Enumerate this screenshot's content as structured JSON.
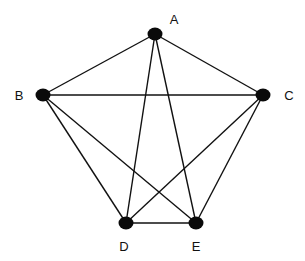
{
  "diagram": {
    "type": "graph",
    "nodes": [
      {
        "id": "A",
        "label": "A",
        "x": 155,
        "y": 34,
        "lx": 174,
        "ly": 24
      },
      {
        "id": "B",
        "label": "B",
        "x": 43,
        "y": 95,
        "lx": 19,
        "ly": 100
      },
      {
        "id": "C",
        "label": "C",
        "x": 263,
        "y": 95,
        "lx": 289,
        "ly": 100
      },
      {
        "id": "D",
        "label": "D",
        "x": 126,
        "y": 223,
        "lx": 124,
        "ly": 251
      },
      {
        "id": "E",
        "label": "E",
        "x": 196,
        "y": 223,
        "lx": 196,
        "ly": 251
      }
    ],
    "edges": [
      [
        "A",
        "B"
      ],
      [
        "A",
        "C"
      ],
      [
        "A",
        "D"
      ],
      [
        "A",
        "E"
      ],
      [
        "B",
        "C"
      ],
      [
        "B",
        "D"
      ],
      [
        "B",
        "E"
      ],
      [
        "C",
        "D"
      ],
      [
        "C",
        "E"
      ],
      [
        "D",
        "E"
      ]
    ],
    "colors": {
      "node": "#0a0a0a",
      "edge": "#111111",
      "background": "#ffffff"
    }
  }
}
